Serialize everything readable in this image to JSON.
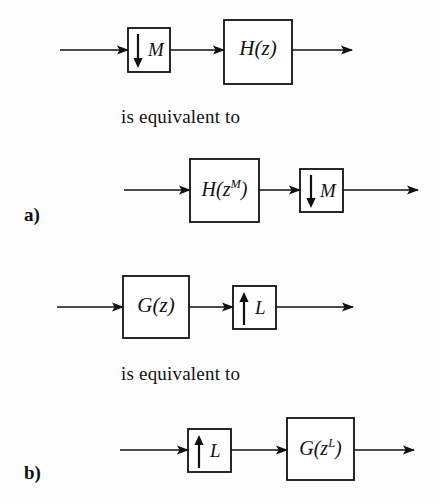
{
  "figure": {
    "background_color": "#fdfdfd",
    "line_color": "#111111",
    "box_fill": "#ffffff",
    "width": 440,
    "height": 504
  },
  "panels": [
    {
      "id": "a",
      "label": "a)",
      "label_pos": {
        "x": 24,
        "y": 204
      },
      "equivalence_text": "is equivalent to",
      "equivalence_pos": {
        "x": 121,
        "y": 106
      },
      "rows": [
        {
          "id": "row-1",
          "y_axis": 50,
          "line_start_x": 60,
          "line_end_x": 352,
          "blocks": [
            {
              "kind": "downsampler",
              "arrow": "down-arrow-icon",
              "arrow_dir": "down",
              "rate_label": "M",
              "x": 128,
              "y": 28,
              "w": 42,
              "h": 44
            },
            {
              "kind": "filter",
              "label": "H(z)",
              "label_base": "H(z)",
              "x": 224,
              "y": 20,
              "w": 68,
              "h": 64
            }
          ]
        },
        {
          "id": "row-2",
          "y_axis": 190,
          "line_start_x": 124,
          "line_end_x": 418,
          "blocks": [
            {
              "kind": "filter",
              "label": "H(z^M)",
              "label_base": "H(z",
              "label_sup": "M",
              "label_tail": ")",
              "x": 190,
              "y": 159,
              "w": 69,
              "h": 63
            },
            {
              "kind": "downsampler",
              "arrow": "down-arrow-icon",
              "arrow_dir": "down",
              "rate_label": "M",
              "x": 300,
              "y": 169,
              "w": 43,
              "h": 43
            }
          ]
        }
      ]
    },
    {
      "id": "b",
      "label": "b)",
      "label_pos": {
        "x": 24,
        "y": 462
      },
      "equivalence_text": "is equivalent to",
      "equivalence_pos": {
        "x": 121,
        "y": 363
      },
      "rows": [
        {
          "id": "row-3",
          "y_axis": 307,
          "line_start_x": 57,
          "line_end_x": 353,
          "blocks": [
            {
              "kind": "filter",
              "label": "G(z)",
              "label_base": "G(z)",
              "x": 123,
              "y": 276,
              "w": 66,
              "h": 62
            },
            {
              "kind": "upsampler",
              "arrow": "up-arrow-icon",
              "arrow_dir": "up",
              "rate_label": "L",
              "x": 233,
              "y": 286,
              "w": 43,
              "h": 43
            }
          ]
        },
        {
          "id": "row-4",
          "y_axis": 450,
          "line_start_x": 120,
          "line_end_x": 414,
          "blocks": [
            {
              "kind": "upsampler",
              "arrow": "up-arrow-icon",
              "arrow_dir": "up",
              "rate_label": "L",
              "x": 188,
              "y": 429,
              "w": 43,
              "h": 43
            },
            {
              "kind": "filter",
              "label": "G(z^L)",
              "label_base": "G(z",
              "label_sup": "L",
              "label_tail": ")",
              "x": 287,
              "y": 418,
              "w": 67,
              "h": 62
            }
          ]
        }
      ]
    }
  ],
  "text_items": {
    "eq_a": "is equivalent to",
    "eq_b": "is equivalent to",
    "label_a": "a)",
    "label_b": "b)",
    "m_rate_1": "M",
    "m_rate_2": "M",
    "l_rate_1": "L",
    "l_rate_2": "L",
    "hz": "H(z)",
    "hzm_base": "H(z",
    "hzm_sup": "M",
    "hzm_tail": ")",
    "gz": "G(z)",
    "gzl_base": "G(z",
    "gzl_sup": "L",
    "gzl_tail": ")"
  }
}
